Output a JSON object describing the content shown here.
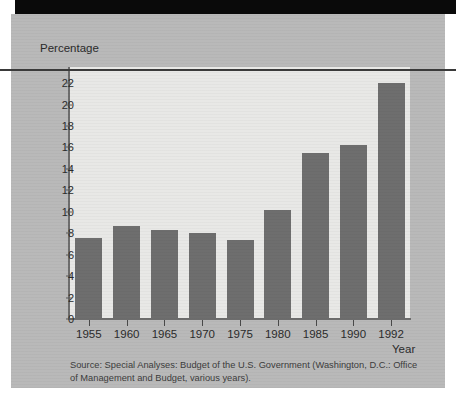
{
  "figure": {
    "y_axis_title": "Percentage",
    "x_axis_title": "Year",
    "source_note": "Source: Special Analyses: Budget of the U.S. Government (Washington, D.C.: Office of Management and Budget, various years)."
  },
  "colors": {
    "bar": "#6e6e6e",
    "plot_background": "#e8e8e6",
    "panel_background": "#b9b9b9",
    "axis": "#6d6d6d",
    "text": "#2b2b2b"
  },
  "chart_data": {
    "type": "bar",
    "title": "",
    "xlabel": "Year",
    "ylabel": "Percentage",
    "categories": [
      "1955",
      "1960",
      "1965",
      "1970",
      "1975",
      "1980",
      "1985",
      "1990",
      "1992"
    ],
    "values": [
      7.6,
      8.7,
      8.3,
      8.0,
      7.4,
      10.2,
      15.5,
      16.2,
      22.0
    ],
    "ylim": [
      0,
      23.5
    ],
    "yticks": [
      0,
      2,
      4,
      6,
      8,
      10,
      12,
      14,
      16,
      18,
      20,
      22
    ],
    "ytick_labels": [
      "0",
      "2",
      "4",
      "6",
      "8",
      "10",
      "12",
      "14",
      "16",
      "18",
      "20",
      "22"
    ],
    "grid": false,
    "legend": false
  }
}
